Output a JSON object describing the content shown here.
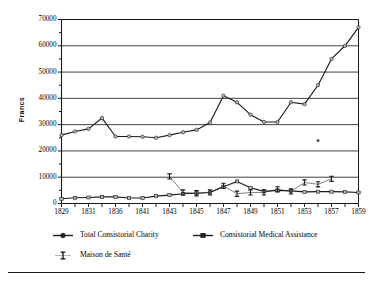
{
  "chart_data": {
    "type": "line",
    "title": "",
    "xlabel": "",
    "ylabel": "Francs",
    "ylim": [
      0,
      70000
    ],
    "ytick_values": [
      0,
      10000,
      20000,
      30000,
      40000,
      50000,
      60000,
      70000
    ],
    "ytick_labels": [
      "0",
      "10000",
      "20000",
      "30000",
      "40000",
      "50000",
      "60000",
      "70000"
    ],
    "yminor_values": [
      5000,
      15000,
      25000,
      35000,
      45000,
      55000,
      65000
    ],
    "grid": "horizontal-major",
    "legend_position": "below-plot",
    "categories": [
      "1829",
      "1830",
      "1831",
      "1834",
      "1836",
      "1839",
      "1841",
      "1842",
      "1843",
      "1844",
      "1845",
      "1846",
      "1847",
      "1848",
      "1849",
      "1850",
      "1851",
      "1852",
      "1853",
      "1855",
      "1857",
      "1858",
      "1859"
    ],
    "xtick_labels": [
      "1829",
      "",
      "1831",
      "",
      "1836",
      "",
      "1841",
      "",
      "1843",
      "",
      "1845",
      "",
      "1847",
      "",
      "1849",
      "",
      "1851",
      "",
      "1853",
      "",
      "1857",
      "",
      "1859"
    ],
    "series": [
      {
        "name": "Total Consistorial Charity",
        "marker": "circle",
        "values": [
          26000,
          27400,
          28400,
          32500,
          25500,
          25500,
          25400,
          25000,
          26000,
          27100,
          28000,
          30800,
          41000,
          38500,
          33800,
          31000,
          31000,
          38500,
          37800,
          45000,
          55000,
          60000,
          67000
        ]
      },
      {
        "name": "Consistorial Medical Assistance",
        "marker": "triangle",
        "values": [
          1800,
          2200,
          2300,
          2500,
          2500,
          2100,
          2100,
          2800,
          3200,
          3700,
          3900,
          4200,
          6400,
          8400,
          6000,
          4600,
          5000,
          4800,
          4400,
          4500,
          4500,
          4400,
          4200
        ]
      },
      {
        "name": "Maison de Santé",
        "marker": "ibeam",
        "values": [
          null,
          null,
          null,
          null,
          null,
          null,
          null,
          null,
          10300,
          4200,
          3900,
          4200,
          6700,
          3700,
          4200,
          4200,
          5400,
          4600,
          8000,
          7300,
          9400,
          null,
          null
        ]
      }
    ],
    "stray_marker": {
      "x_index": 19,
      "value": 24000
    }
  },
  "legend": {
    "items": [
      {
        "label": "Total Consistorial Charity",
        "marker": "circle"
      },
      {
        "label": "Consistorial Medical Assistance",
        "marker": "triangle"
      },
      {
        "label": "Maison de Santé",
        "marker": "ibeam"
      }
    ]
  },
  "colors": {
    "line": "#1a1a1a",
    "grid": "#2b2b2b",
    "axis": "#1a1a1a",
    "marker_fill": "#b8b8b8",
    "background": "#ffffff"
  }
}
